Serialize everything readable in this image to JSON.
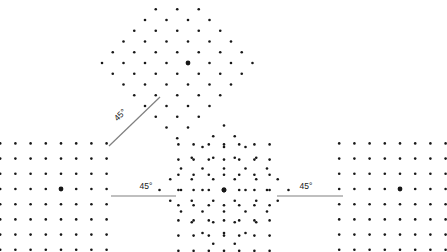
{
  "figure": {
    "background_color": "#ffffff",
    "dot_color": "#171717",
    "line_color": "#808080",
    "label_color": "#1a1a1a",
    "dot_radius": 1.3,
    "center_dot_radius": 2.4,
    "canvas": {
      "width": 447,
      "height": 252
    }
  },
  "annotations": [
    {
      "id": "angle-diagonal",
      "label": "45°",
      "value": 45,
      "unit": "degrees",
      "orientation": "diagonal",
      "rotation_deg": -45,
      "label_x": 122,
      "label_y": 117,
      "line": {
        "x1": 109,
        "y1": 146,
        "x2": 160,
        "y2": 97
      }
    },
    {
      "id": "angle-left-center",
      "label": "45°",
      "value": 45,
      "unit": "degrees",
      "orientation": "horizontal",
      "rotation_deg": 0,
      "label_x": 146,
      "label_y": 189,
      "line": {
        "x1": 111,
        "y1": 196,
        "x2": 176,
        "y2": 196
      }
    },
    {
      "id": "angle-center-right",
      "label": "45°",
      "value": 45,
      "unit": "degrees",
      "orientation": "horizontal",
      "rotation_deg": 0,
      "label_x": 306,
      "label_y": 189,
      "line": {
        "x1": 277,
        "y1": 196,
        "x2": 343,
        "y2": 196
      }
    }
  ],
  "lattices": [
    {
      "id": "lattice-left",
      "name": "left-square-lattice",
      "type": "square",
      "rotation_deg": 0,
      "spacing": 15.2,
      "origin_x": 61,
      "origin_y": 189,
      "cols": [
        -4,
        -3,
        -2,
        -1,
        0,
        1,
        2,
        3
      ],
      "rows": [
        -3,
        -2,
        -1,
        0,
        1,
        2,
        3,
        4
      ],
      "marked_point": {
        "i": 0,
        "j": 0
      }
    },
    {
      "id": "lattice-diagonal",
      "name": "diagonal-square-lattice",
      "type": "square",
      "rotation_deg": 45,
      "spacing": 15.2,
      "origin_x": 188,
      "origin_y": 63,
      "cols": [
        -4,
        -3,
        -2,
        -1,
        0,
        1,
        2,
        3
      ],
      "rows": [
        -3,
        -2,
        -1,
        0,
        1,
        2,
        3,
        4
      ],
      "marked_point": {
        "i": 0,
        "j": 0
      }
    },
    {
      "id": "lattice-center-a",
      "name": "center-superposed-lattice-upright",
      "type": "square",
      "rotation_deg": 0,
      "spacing": 15.2,
      "origin_x": 224,
      "origin_y": 190,
      "cols": [
        -3,
        -2,
        -1,
        0,
        1,
        2,
        3
      ],
      "rows": [
        -3,
        -2,
        -1,
        0,
        1,
        2,
        3,
        4
      ],
      "marked_point": {
        "i": 0,
        "j": 0
      }
    },
    {
      "id": "lattice-center-b",
      "name": "center-superposed-lattice-rotated",
      "type": "square",
      "rotation_deg": 45,
      "spacing": 15.2,
      "origin_x": 224,
      "origin_y": 190,
      "cols": [
        -3,
        -2,
        -1,
        0,
        1,
        2,
        3
      ],
      "rows": [
        -3,
        -2,
        -1,
        0,
        1,
        2,
        3
      ],
      "marked_point": {
        "i": 0,
        "j": 0
      }
    },
    {
      "id": "lattice-right",
      "name": "right-square-lattice",
      "type": "square",
      "rotation_deg": 0,
      "spacing": 15.2,
      "origin_x": 400,
      "origin_y": 189,
      "cols": [
        -4,
        -3,
        -2,
        -1,
        0,
        1,
        2,
        3
      ],
      "rows": [
        -3,
        -2,
        -1,
        0,
        1,
        2,
        3,
        4
      ],
      "marked_point": {
        "i": 0,
        "j": 0
      }
    }
  ]
}
